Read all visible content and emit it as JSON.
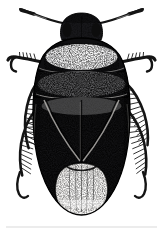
{
  "image": {
    "kind": "scientific-illustration",
    "technique": "stipple-engraving",
    "view": "dorsal",
    "subject": "aquatic beetle",
    "width": 163,
    "height": 233,
    "background_color": "#ffffff",
    "ink_color": "#141414",
    "midtone_color": "#555555",
    "highlight_color": "#e8e6e2",
    "alt_text": "Black and white stipple engraving of an aquatic beetle seen from above, with two curving antennae, a broad pronotum bearing a pale band, dark elytra and a pale striated abdomen tip, flanked by fringed swimming legs."
  },
  "anatomy": {
    "parts": [
      {
        "id": "antenna-left",
        "label": "Left antenna",
        "tone": "dark"
      },
      {
        "id": "antenna-right",
        "label": "Right antenna",
        "tone": "dark"
      },
      {
        "id": "head",
        "label": "Head",
        "tone": "dark"
      },
      {
        "id": "eye-left",
        "label": "Left compound eye",
        "tone": "dark"
      },
      {
        "id": "eye-right",
        "label": "Right compound eye",
        "tone": "dark"
      },
      {
        "id": "pronotum",
        "label": "Pronotum",
        "tone": "banded"
      },
      {
        "id": "pronotum-band",
        "label": "Pale pronotal band",
        "tone": "light"
      },
      {
        "id": "mesonotum",
        "label": "Mesonotum",
        "tone": "dark"
      },
      {
        "id": "scutellum",
        "label": "Scutellum",
        "tone": "dark"
      },
      {
        "id": "elytron-left",
        "label": "Left elytron",
        "tone": "dark"
      },
      {
        "id": "elytron-right",
        "label": "Right elytron",
        "tone": "dark"
      },
      {
        "id": "elytral-suture",
        "label": "Elytral suture",
        "tone": "dark"
      },
      {
        "id": "abdomen-tip",
        "label": "Membranous abdomen tip",
        "tone": "light"
      },
      {
        "id": "foreleg-left",
        "label": "Left foreleg",
        "tone": "dark"
      },
      {
        "id": "foreleg-right",
        "label": "Right foreleg",
        "tone": "dark"
      },
      {
        "id": "midleg-left",
        "label": "Left middle leg",
        "tone": "dark"
      },
      {
        "id": "midleg-right",
        "label": "Right middle leg",
        "tone": "dark"
      },
      {
        "id": "hindleg-left",
        "label": "Left hind swimming leg",
        "tone": "dark"
      },
      {
        "id": "hindleg-right",
        "label": "Right hind swimming leg",
        "tone": "dark"
      }
    ]
  },
  "artifacts": {
    "scan_line": {
      "label": "Faint horizontal scan line",
      "y": 227,
      "color": "#d9d9d9"
    }
  }
}
